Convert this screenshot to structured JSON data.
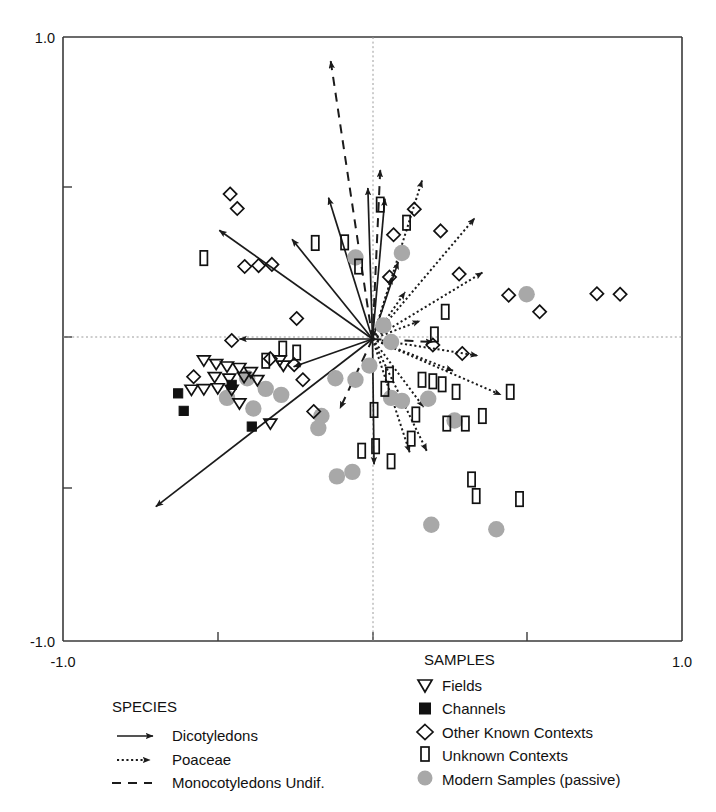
{
  "chart_data": {
    "type": "scatter",
    "title": "",
    "xlabel": "",
    "ylabel": "",
    "xlim": [
      -1.0,
      1.0
    ],
    "ylim": [
      -1.0,
      1.0
    ],
    "grid": false,
    "zero_lines": true,
    "axis_ticks": {
      "x": [
        -1.0,
        -0.5,
        0.0,
        0.5,
        1.0
      ],
      "y": [
        -1.0,
        -0.5,
        0.0,
        0.5,
        1.0
      ],
      "x_labeled": [
        "-1.0",
        "1.0"
      ],
      "y_labeled": [
        "1.0",
        "-1.0"
      ]
    },
    "tick_labels": {
      "y_top": "1.0",
      "y_bottom": "-1.0",
      "x_left": "-1.0",
      "x_right": "1.0"
    },
    "series": [
      {
        "name": "Fields",
        "marker": "open-down-triangle",
        "points": [
          [
            -0.545,
            -0.073
          ],
          [
            -0.505,
            -0.085
          ],
          [
            -0.47,
            -0.093
          ],
          [
            -0.43,
            -0.098
          ],
          [
            -0.393,
            -0.112
          ],
          [
            -0.51,
            -0.128
          ],
          [
            -0.463,
            -0.133
          ],
          [
            -0.415,
            -0.128
          ],
          [
            -0.372,
            -0.138
          ],
          [
            -0.585,
            -0.17
          ],
          [
            -0.545,
            -0.168
          ],
          [
            -0.5,
            -0.165
          ],
          [
            -0.455,
            -0.17
          ],
          [
            -0.43,
            -0.215
          ],
          [
            -0.33,
            -0.282
          ],
          [
            -0.3,
            -0.073
          ],
          [
            -0.288,
            -0.09
          ]
        ]
      },
      {
        "name": "Channels",
        "marker": "filled-square",
        "points": [
          [
            -0.628,
            -0.18
          ],
          [
            -0.61,
            -0.238
          ],
          [
            -0.455,
            -0.152
          ],
          [
            -0.39,
            -0.29
          ]
        ]
      },
      {
        "name": "Other Known Contexts",
        "marker": "open-diamond",
        "points": [
          [
            -0.413,
            0.24
          ],
          [
            -0.368,
            0.243
          ],
          [
            -0.325,
            0.247
          ],
          [
            -0.455,
            -0.005
          ],
          [
            -0.33,
            -0.065
          ],
          [
            -0.253,
            -0.085
          ],
          [
            -0.578,
            -0.125
          ],
          [
            -0.225,
            -0.135
          ],
          [
            -0.19,
            -0.24
          ],
          [
            -0.46,
            0.48
          ],
          [
            -0.437,
            0.432
          ],
          [
            -0.245,
            0.068
          ],
          [
            0.068,
            0.345
          ],
          [
            0.135,
            0.43
          ],
          [
            0.055,
            0.205
          ],
          [
            0.22,
            0.358
          ],
          [
            0.28,
            0.215
          ],
          [
            0.44,
            0.145
          ],
          [
            0.725,
            0.15
          ],
          [
            0.8,
            0.148
          ],
          [
            0.54,
            0.09
          ],
          [
            0.29,
            -0.048
          ],
          [
            0.195,
            -0.02
          ]
        ]
      },
      {
        "name": "Unknown Contexts",
        "marker": "open-tall-rect",
        "points": [
          [
            -0.185,
            0.318
          ],
          [
            -0.09,
            0.32
          ],
          [
            -0.29,
            -0.032
          ],
          [
            -0.245,
            -0.045
          ],
          [
            -0.345,
            -0.072
          ],
          [
            -0.545,
            0.268
          ],
          [
            0.025,
            0.445
          ],
          [
            0.11,
            0.385
          ],
          [
            -0.045,
            0.24
          ],
          [
            0.235,
            0.09
          ],
          [
            0.2,
            0.015
          ],
          [
            0.055,
            -0.118
          ],
          [
            0.16,
            -0.135
          ],
          [
            0.195,
            -0.14
          ],
          [
            0.225,
            -0.15
          ],
          [
            0.04,
            -0.165
          ],
          [
            0.27,
            -0.175
          ],
          [
            0.005,
            -0.235
          ],
          [
            0.14,
            -0.25
          ],
          [
            0.445,
            -0.175
          ],
          [
            0.355,
            -0.255
          ],
          [
            0.24,
            -0.28
          ],
          [
            0.3,
            -0.28
          ],
          [
            0.125,
            -0.33
          ],
          [
            0.01,
            -0.355
          ],
          [
            -0.035,
            -0.37
          ],
          [
            0.06,
            -0.405
          ],
          [
            0.32,
            -0.465
          ],
          [
            0.335,
            -0.52
          ],
          [
            0.475,
            -0.53
          ]
        ]
      },
      {
        "name": "Modern Samples (passive)",
        "marker": "gray-circle",
        "points": [
          [
            -0.055,
            0.27
          ],
          [
            0.095,
            0.285
          ],
          [
            0.498,
            0.148
          ],
          [
            0.035,
            0.045
          ],
          [
            0.06,
            -0.01
          ],
          [
            -0.405,
            -0.13
          ],
          [
            -0.345,
            -0.165
          ],
          [
            -0.295,
            -0.185
          ],
          [
            -0.47,
            -0.195
          ],
          [
            -0.385,
            -0.23
          ],
          [
            -0.12,
            -0.13
          ],
          [
            -0.055,
            -0.135
          ],
          [
            -0.165,
            -0.255
          ],
          [
            -0.175,
            -0.295
          ],
          [
            -0.01,
            -0.088
          ],
          [
            0.06,
            -0.195
          ],
          [
            0.095,
            -0.205
          ],
          [
            0.18,
            -0.198
          ],
          [
            0.265,
            -0.27
          ],
          [
            -0.115,
            -0.455
          ],
          [
            -0.065,
            -0.44
          ],
          [
            0.19,
            -0.615
          ],
          [
            0.4,
            -0.63
          ]
        ]
      }
    ],
    "vectors": [
      {
        "group": "Dicotyledons",
        "style": "solid",
        "dx": -0.495,
        "dy": 0.36
      },
      {
        "group": "Dicotyledons",
        "style": "solid",
        "dx": -0.26,
        "dy": 0.33
      },
      {
        "group": "Dicotyledons",
        "style": "solid",
        "dx": -0.142,
        "dy": 0.468
      },
      {
        "group": "Dicotyledons",
        "style": "solid",
        "dx": -0.015,
        "dy": 0.5
      },
      {
        "group": "Dicotyledons",
        "style": "solid",
        "dx": 0.04,
        "dy": 0.465
      },
      {
        "group": "Dicotyledons",
        "style": "solid",
        "dx": 0.083,
        "dy": 0.255
      },
      {
        "group": "Dicotyledons",
        "style": "solid",
        "dx": -0.43,
        "dy": 0.0
      },
      {
        "group": "Dicotyledons",
        "style": "solid",
        "dx": -0.255,
        "dy": -0.092
      },
      {
        "group": "Dicotyledons",
        "style": "solid",
        "dx": -0.7,
        "dy": -0.555
      },
      {
        "group": "Dicotyledons",
        "style": "solid",
        "dx": 0.005,
        "dy": -0.415
      },
      {
        "group": "Poaceae",
        "style": "dotted",
        "dx": 0.16,
        "dy": 0.525
      },
      {
        "group": "Poaceae",
        "style": "dotted",
        "dx": 0.33,
        "dy": 0.4
      },
      {
        "group": "Poaceae",
        "style": "dotted",
        "dx": 0.063,
        "dy": 0.205
      },
      {
        "group": "Poaceae",
        "style": "dotted",
        "dx": 0.105,
        "dy": 0.155
      },
      {
        "group": "Poaceae",
        "style": "dotted",
        "dx": 0.355,
        "dy": 0.22
      },
      {
        "group": "Poaceae",
        "style": "dotted",
        "dx": 0.153,
        "dy": 0.06
      },
      {
        "group": "Poaceae",
        "style": "dotted",
        "dx": 0.34,
        "dy": -0.055
      },
      {
        "group": "Poaceae",
        "style": "dotted",
        "dx": 0.26,
        "dy": -0.105
      },
      {
        "group": "Poaceae",
        "style": "dotted",
        "dx": 0.415,
        "dy": -0.185
      },
      {
        "group": "Poaceae",
        "style": "dotted",
        "dx": 0.165,
        "dy": -0.225
      },
      {
        "group": "Poaceae",
        "style": "dotted",
        "dx": 0.175,
        "dy": -0.37
      },
      {
        "group": "Poaceae",
        "style": "dotted",
        "dx": 0.12,
        "dy": -0.375
      },
      {
        "group": "Monocotyledons Undif.",
        "style": "dashed",
        "dx": -0.135,
        "dy": 0.92
      },
      {
        "group": "Monocotyledons Undif.",
        "style": "dashed",
        "dx": 0.025,
        "dy": 0.56
      },
      {
        "group": "Monocotyledons Undif.",
        "style": "dashed",
        "dx": 0.195,
        "dy": -0.01
      },
      {
        "group": "Monocotyledons Undif.",
        "style": "dashed",
        "dx": -0.105,
        "dy": -0.23
      }
    ]
  },
  "axes": {
    "y_top_label": "1.0",
    "y_bottom_label": "-1.0",
    "x_left_label": "-1.0",
    "x_right_label": "1.0"
  },
  "legend_species": {
    "title": "SPECIES",
    "items": [
      {
        "label": "Dicotyledons",
        "style": "solid-arrow",
        "icon": "solid-arrow-icon"
      },
      {
        "label": "Poaceae",
        "style": "dotted-arrow",
        "icon": "dotted-arrow-icon"
      },
      {
        "label": "Monocotyledons Undif.",
        "style": "dashed-arrow",
        "icon": "dashed-arrow-icon"
      }
    ]
  },
  "legend_samples": {
    "title": "SAMPLES",
    "items": [
      {
        "label": "Fields",
        "marker": "open-down-triangle",
        "icon": "down-triangle-icon"
      },
      {
        "label": "Channels",
        "marker": "filled-square",
        "icon": "filled-square-icon"
      },
      {
        "label": "Other Known Contexts",
        "marker": "open-diamond",
        "icon": "diamond-icon"
      },
      {
        "label": "Unknown Contexts",
        "marker": "open-tall-rect",
        "icon": "tall-rect-icon"
      },
      {
        "label": "Modern Samples (passive)",
        "marker": "gray-circle",
        "icon": "gray-circle-icon"
      }
    ]
  },
  "colors": {
    "ink": "#1b1b1b",
    "axis": "#3a3a3a",
    "zero_line": "#9a9a9a",
    "modern_sample_fill": "#a8a8a8"
  }
}
